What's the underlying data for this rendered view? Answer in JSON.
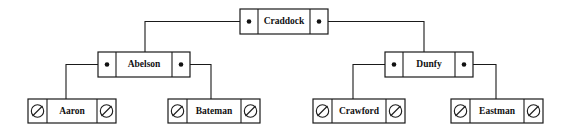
{
  "diagram": {
    "type": "binary-search-tree",
    "canvas": {
      "width": 566,
      "height": 137
    },
    "colors": {
      "background": "#ffffff",
      "stroke": "#1a1a1a",
      "text": "#111111",
      "pointer_dot": "#111111"
    },
    "legend": {
      "pointer_symbol": "filled-dot",
      "null_symbol": "slashed-circle"
    }
  },
  "nodes": [
    {
      "id": "craddock",
      "label": "Craddock",
      "level": 0,
      "box": {
        "x": 240,
        "y": 9,
        "width": 88,
        "height": 25
      },
      "left_cell_width": 18,
      "right_cell_width": 18,
      "left_pointer": "dot",
      "right_pointer": "dot",
      "left_child": "abelson",
      "right_child": "dunfy"
    },
    {
      "id": "abelson",
      "label": "Abelson",
      "level": 1,
      "box": {
        "x": 98,
        "y": 52,
        "width": 92,
        "height": 25
      },
      "left_cell_width": 18,
      "right_cell_width": 18,
      "left_pointer": "dot",
      "right_pointer": "dot",
      "left_child": "aaron",
      "right_child": "bateman"
    },
    {
      "id": "dunfy",
      "label": "Dunfy",
      "level": 1,
      "box": {
        "x": 385,
        "y": 52,
        "width": 88,
        "height": 25
      },
      "left_cell_width": 18,
      "right_cell_width": 18,
      "left_pointer": "dot",
      "right_pointer": "dot",
      "left_child": "crawford",
      "right_child": "eastman"
    },
    {
      "id": "aaron",
      "label": "Aaron",
      "level": 2,
      "box": {
        "x": 28,
        "y": 99,
        "width": 88,
        "height": 24
      },
      "left_cell_width": 19,
      "right_cell_width": 19,
      "left_pointer": "null",
      "right_pointer": "null",
      "left_child": null,
      "right_child": null
    },
    {
      "id": "bateman",
      "label": "Bateman",
      "level": 2,
      "box": {
        "x": 168,
        "y": 99,
        "width": 92,
        "height": 24
      },
      "left_cell_width": 19,
      "right_cell_width": 19,
      "left_pointer": "null",
      "right_pointer": "null",
      "left_child": null,
      "right_child": null
    },
    {
      "id": "crawford",
      "label": "Crawford",
      "level": 2,
      "box": {
        "x": 313,
        "y": 99,
        "width": 92,
        "height": 24
      },
      "left_cell_width": 19,
      "right_cell_width": 19,
      "left_pointer": "null",
      "right_pointer": "null",
      "left_child": null,
      "right_child": null
    },
    {
      "id": "eastman",
      "label": "Eastman",
      "level": 2,
      "box": {
        "x": 451,
        "y": 99,
        "width": 92,
        "height": 24
      },
      "left_cell_width": 19,
      "right_cell_width": 19,
      "left_pointer": "null",
      "right_pointer": "null",
      "left_child": null,
      "right_child": null
    }
  ],
  "edges": [
    {
      "id": "craddock-left-abelson",
      "from": "craddock",
      "side": "left",
      "to": "abelson",
      "path": "M 249 21.5 L 145 21.5 L 145 52"
    },
    {
      "id": "craddock-right-dunfy",
      "from": "craddock",
      "side": "right",
      "to": "dunfy",
      "path": "M 319 21.5 L 424 21.5 L 424 52"
    },
    {
      "id": "abelson-left-aaron",
      "from": "abelson",
      "side": "left",
      "to": "aaron",
      "path": "M 107 64.5 L 66 64.5 L 66 99"
    },
    {
      "id": "abelson-right-bateman",
      "from": "abelson",
      "side": "right",
      "to": "bateman",
      "path": "M 181 64.5 L 211 64.5 L 211 99"
    },
    {
      "id": "dunfy-left-crawford",
      "from": "dunfy",
      "side": "left",
      "to": "crawford",
      "path": "M 394 64.5 L 353 64.5 L 353 99"
    },
    {
      "id": "dunfy-right-eastman",
      "from": "dunfy",
      "side": "right",
      "to": "eastman",
      "path": "M 464 64.5 L 496 64.5 L 496 99"
    }
  ]
}
